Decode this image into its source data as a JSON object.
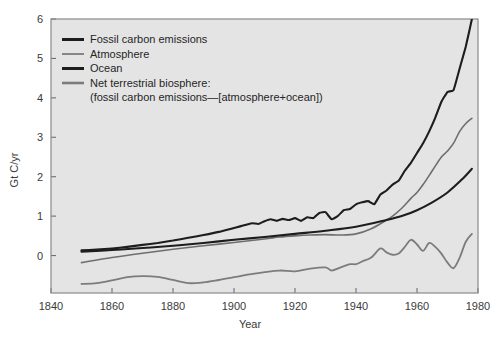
{
  "chart_data": {
    "type": "line",
    "title": "",
    "xlabel": "Year",
    "ylabel": "Gt C/yr",
    "xlim": [
      1840,
      1980
    ],
    "ylim": [
      -0.95,
      6.0
    ],
    "xticks": [
      1840,
      1860,
      1880,
      1900,
      1920,
      1940,
      1960,
      1980
    ],
    "yticks": [
      0,
      1,
      2,
      3,
      4,
      5,
      6
    ],
    "grid": false,
    "legend_position": "top-left",
    "plot_background": "#e4e4e4",
    "series": [
      {
        "name": "Fossil carbon emissions",
        "color": "#1d1d1d",
        "width": 2.1,
        "x": [
          1850,
          1855,
          1860,
          1865,
          1870,
          1875,
          1880,
          1885,
          1890,
          1895,
          1900,
          1902,
          1904,
          1906,
          1908,
          1910,
          1912,
          1914,
          1916,
          1918,
          1920,
          1922,
          1924,
          1926,
          1928,
          1930,
          1932,
          1934,
          1936,
          1938,
          1940,
          1942,
          1944,
          1946,
          1948,
          1950,
          1952,
          1954,
          1956,
          1958,
          1960,
          1962,
          1964,
          1966,
          1968,
          1970,
          1972,
          1974,
          1976,
          1978
        ],
        "y": [
          0.13,
          0.15,
          0.18,
          0.22,
          0.27,
          0.32,
          0.38,
          0.45,
          0.52,
          0.6,
          0.7,
          0.74,
          0.78,
          0.82,
          0.8,
          0.87,
          0.92,
          0.88,
          0.93,
          0.9,
          0.95,
          0.88,
          0.97,
          0.95,
          1.08,
          1.1,
          0.92,
          1.0,
          1.15,
          1.18,
          1.3,
          1.35,
          1.38,
          1.3,
          1.55,
          1.65,
          1.8,
          1.9,
          2.15,
          2.35,
          2.6,
          2.85,
          3.15,
          3.5,
          3.9,
          4.15,
          4.2,
          4.75,
          5.3,
          6.0
        ]
      },
      {
        "name": "Atmosphere",
        "color": "#6e6e6e",
        "width": 1.6,
        "x": [
          1850,
          1860,
          1870,
          1880,
          1890,
          1900,
          1910,
          1915,
          1920,
          1925,
          1930,
          1935,
          1940,
          1945,
          1950,
          1952,
          1955,
          1958,
          1960,
          1962,
          1965,
          1968,
          1970,
          1972,
          1974,
          1976,
          1978
        ],
        "y": [
          -0.18,
          -0.05,
          0.06,
          0.16,
          0.25,
          0.33,
          0.42,
          0.47,
          0.5,
          0.52,
          0.53,
          0.52,
          0.55,
          0.68,
          0.9,
          1.0,
          1.2,
          1.45,
          1.6,
          1.8,
          2.15,
          2.5,
          2.65,
          2.85,
          3.15,
          3.35,
          3.48
        ]
      },
      {
        "name": "Ocean",
        "color": "#1d1d1d",
        "width": 2.1,
        "x": [
          1850,
          1860,
          1870,
          1880,
          1890,
          1900,
          1910,
          1920,
          1930,
          1940,
          1950,
          1955,
          1960,
          1965,
          1970,
          1975,
          1978
        ],
        "y": [
          0.1,
          0.14,
          0.19,
          0.25,
          0.32,
          0.4,
          0.47,
          0.55,
          0.63,
          0.73,
          0.9,
          1.0,
          1.15,
          1.35,
          1.6,
          1.95,
          2.2
        ]
      },
      {
        "name": "Net terrestrial biosphere",
        "color": "#7c7c7c",
        "width": 1.8,
        "x": [
          1850,
          1855,
          1860,
          1865,
          1870,
          1875,
          1880,
          1885,
          1890,
          1895,
          1900,
          1905,
          1910,
          1915,
          1920,
          1925,
          1930,
          1932,
          1935,
          1938,
          1940,
          1942,
          1945,
          1948,
          1950,
          1952,
          1954,
          1956,
          1958,
          1960,
          1962,
          1964,
          1966,
          1968,
          1970,
          1972,
          1974,
          1976,
          1978
        ],
        "y": [
          -0.72,
          -0.7,
          -0.63,
          -0.55,
          -0.52,
          -0.54,
          -0.62,
          -0.7,
          -0.68,
          -0.62,
          -0.55,
          -0.48,
          -0.42,
          -0.38,
          -0.4,
          -0.33,
          -0.3,
          -0.38,
          -0.3,
          -0.22,
          -0.22,
          -0.15,
          -0.05,
          0.18,
          0.08,
          0.02,
          0.05,
          0.22,
          0.4,
          0.28,
          0.12,
          0.32,
          0.22,
          0.05,
          -0.18,
          -0.32,
          -0.05,
          0.35,
          0.55
        ]
      }
    ],
    "legend": [
      {
        "label": "Fossil carbon emissions",
        "color": "#1d1d1d",
        "width": 3.0
      },
      {
        "label": "Atmosphere",
        "color": "#757575",
        "width": 1.7
      },
      {
        "label": "Ocean",
        "color": "#1d1d1d",
        "width": 3.0
      },
      {
        "label": "Net terrestrial biosphere:",
        "color": "#7c7c7c",
        "width": 2.6
      }
    ],
    "legend_note": "(fossil carbon emissions—[atmosphere+ocean])"
  }
}
